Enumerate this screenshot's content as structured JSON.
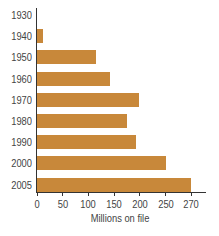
{
  "chart_data": {
    "type": "bar",
    "orientation": "horizontal",
    "categories": [
      "1930",
      "1940",
      "1950",
      "1960",
      "1970",
      "1980",
      "1990",
      "2000",
      "2005"
    ],
    "values": [
      0,
      12,
      115,
      142,
      198,
      175,
      192,
      250,
      300
    ],
    "title": "",
    "xlabel": "Millions on file",
    "ylabel": "",
    "xticks": [
      "0",
      "50",
      "100",
      "150",
      "200",
      "250",
      "270"
    ],
    "xlim": [
      0,
      310
    ],
    "grid": false,
    "legend": null,
    "bar_color": "#c8883a"
  }
}
